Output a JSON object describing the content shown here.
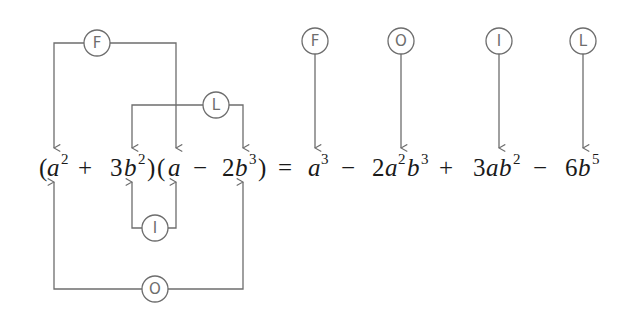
{
  "diagram": {
    "colors": {
      "line": "#6d6d6d",
      "text": "#1a1a1a",
      "background": "#ffffff"
    },
    "labels": {
      "first": "F",
      "outer": "O",
      "inner": "I",
      "last": "L"
    },
    "equation": {
      "lhs_factor1": {
        "open": "(",
        "t1_var": "a",
        "t1_exp": "2",
        "op": "+",
        "t2_coef": "3",
        "t2_var": "b",
        "t2_exp": "2",
        "close": ")"
      },
      "lhs_factor2": {
        "open": "(",
        "t1_var": "a",
        "op": "−",
        "t2_coef": "2",
        "t2_var": "b",
        "t2_exp": "3",
        "close": ")"
      },
      "equals": "=",
      "rhs": [
        {
          "sign": "",
          "coef": "",
          "vars": [
            {
              "v": "a",
              "e": "3"
            }
          ]
        },
        {
          "sign": "−",
          "coef": "2",
          "vars": [
            {
              "v": "a",
              "e": "2"
            },
            {
              "v": "b",
              "e": "3"
            }
          ]
        },
        {
          "sign": "+",
          "coef": "3",
          "vars": [
            {
              "v": "a",
              "e": ""
            },
            {
              "v": "b",
              "e": "2"
            }
          ]
        },
        {
          "sign": "−",
          "coef": "6",
          "vars": [
            {
              "v": "b",
              "e": "5"
            }
          ]
        }
      ]
    },
    "connectors": [
      {
        "label": "F",
        "connects": [
          "a^2",
          "a"
        ]
      },
      {
        "label": "O",
        "connects": [
          "a^2",
          "2b^3"
        ]
      },
      {
        "label": "I",
        "connects": [
          "3b^2",
          "a"
        ]
      },
      {
        "label": "L",
        "connects": [
          "3b^2",
          "2b^3"
        ]
      }
    ],
    "result_markers": [
      {
        "label": "F",
        "term": "a^3"
      },
      {
        "label": "O",
        "term": "-2a^2b^3"
      },
      {
        "label": "I",
        "term": "+3ab^2"
      },
      {
        "label": "L",
        "term": "-6b^5"
      }
    ]
  }
}
